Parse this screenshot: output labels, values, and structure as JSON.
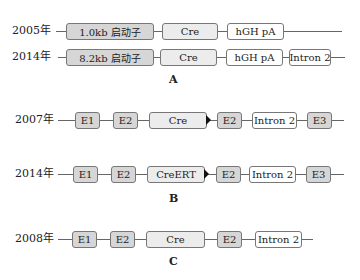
{
  "panels": {
    "A": {
      "label": "A",
      "rows": [
        {
          "year": "2005年",
          "elements": [
            "1.0kb 启动子",
            "Cre",
            "hGH pA"
          ]
        },
        {
          "year": "2014年",
          "elements": [
            "8.2kb 启动子",
            "Cre",
            "hGH pA",
            "Intron 2"
          ]
        }
      ]
    },
    "B": {
      "label": "B",
      "rows": [
        {
          "year": "2007年",
          "elements": [
            "E1",
            "E2",
            "Cre",
            "E2",
            "Intron 2",
            "E3"
          ]
        },
        {
          "year": "2014年",
          "elements": [
            "E1",
            "E2",
            "CreERT",
            "E2",
            "Intron 2",
            "E3"
          ]
        }
      ]
    },
    "C": {
      "label": "C",
      "rows": [
        {
          "year": "2008年",
          "elements": [
            "E1",
            "E2",
            "Cre",
            "E2",
            "Intron 2"
          ]
        }
      ]
    }
  }
}
